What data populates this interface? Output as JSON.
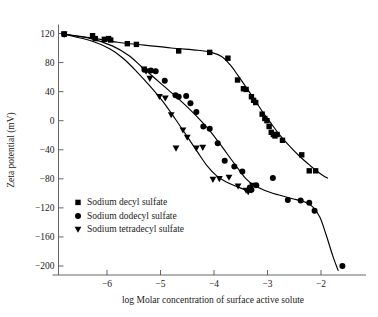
{
  "chart_data": {
    "type": "scatter",
    "title": "",
    "xlabel": "log Molar concentration of surface active solute",
    "ylabel": "Zeta potential (mV)",
    "xlim": [
      -7.0,
      -1.3
    ],
    "ylim": [
      -210,
      132
    ],
    "xticks": [
      -6,
      -5,
      -4,
      -3,
      -2
    ],
    "xtick_labels": [
      "−6",
      "−5",
      "−4",
      "−3",
      "−2"
    ],
    "yticks": [
      120,
      80,
      40,
      0,
      -40,
      -80,
      -120,
      -160,
      -200
    ],
    "ytick_labels": [
      "120",
      "80",
      "40",
      "0",
      "−40",
      "−80",
      "−120",
      "−160",
      "−200"
    ],
    "grid": false,
    "legend_position": "lower-left-inside",
    "series": [
      {
        "name": "Sodium decyl sulfate",
        "marker": "square",
        "color": "#000000",
        "points": [
          [
            -6.8,
            119
          ],
          [
            -6.27,
            117
          ],
          [
            -6.22,
            113
          ],
          [
            -6.05,
            112
          ],
          [
            -5.97,
            113
          ],
          [
            -5.93,
            111
          ],
          [
            -5.62,
            106
          ],
          [
            -5.45,
            105
          ],
          [
            -4.66,
            96
          ],
          [
            -4.08,
            94
          ],
          [
            -3.74,
            86
          ],
          [
            -3.56,
            56
          ],
          [
            -3.45,
            44
          ],
          [
            -3.4,
            43
          ],
          [
            -3.3,
            33
          ],
          [
            -3.26,
            28
          ],
          [
            -3.22,
            25
          ],
          [
            -3.1,
            9
          ],
          [
            -3.05,
            3
          ],
          [
            -3.01,
            0
          ],
          [
            -2.97,
            -8
          ],
          [
            -2.93,
            -16
          ],
          [
            -2.89,
            -19
          ],
          [
            -2.86,
            -21
          ],
          [
            -2.82,
            -19
          ],
          [
            -2.72,
            -27
          ],
          [
            -2.36,
            -47
          ],
          [
            -2.22,
            -69
          ],
          [
            -2.1,
            -69
          ]
        ],
        "curve": [
          [
            -6.8,
            119
          ],
          [
            -6.3,
            114
          ],
          [
            -5.8,
            108
          ],
          [
            -5.3,
            104
          ],
          [
            -4.8,
            100
          ],
          [
            -4.3,
            97
          ],
          [
            -4.05,
            94
          ],
          [
            -3.85,
            88
          ],
          [
            -3.7,
            77
          ],
          [
            -3.55,
            62
          ],
          [
            -3.4,
            46
          ],
          [
            -3.25,
            30
          ],
          [
            -3.1,
            13
          ],
          [
            -2.95,
            -2
          ],
          [
            -2.8,
            -17
          ],
          [
            -2.6,
            -34
          ],
          [
            -2.4,
            -49
          ],
          [
            -2.2,
            -62
          ],
          [
            -2.05,
            -71
          ],
          [
            -1.95,
            -76
          ],
          [
            -1.88,
            -79
          ]
        ]
      },
      {
        "name": "Sodium dodecyl sulfate",
        "marker": "circle",
        "color": "#000000",
        "points": [
          [
            -6.8,
            119
          ],
          [
            -5.3,
            70
          ],
          [
            -5.18,
            69
          ],
          [
            -5.09,
            68
          ],
          [
            -4.92,
            55
          ],
          [
            -4.72,
            35
          ],
          [
            -4.66,
            33
          ],
          [
            -4.52,
            34
          ],
          [
            -4.44,
            24
          ],
          [
            -4.33,
            12
          ],
          [
            -4.2,
            -8
          ],
          [
            -4.08,
            -11
          ],
          [
            -3.93,
            -31
          ],
          [
            -3.8,
            -55
          ],
          [
            -3.62,
            -63
          ],
          [
            -3.47,
            -70
          ],
          [
            -3.33,
            -92
          ],
          [
            -3.3,
            -95
          ],
          [
            -3.21,
            -89
          ],
          [
            -2.9,
            -79
          ],
          [
            -2.62,
            -109
          ],
          [
            -2.38,
            -110
          ],
          [
            -2.22,
            -113
          ],
          [
            -2.12,
            -124
          ],
          [
            -1.6,
            -200
          ]
        ],
        "curve": [
          [
            -6.8,
            119
          ],
          [
            -6.3,
            113
          ],
          [
            -5.9,
            103
          ],
          [
            -5.6,
            90
          ],
          [
            -5.35,
            74
          ],
          [
            -5.1,
            58
          ],
          [
            -4.85,
            42
          ],
          [
            -4.6,
            26
          ],
          [
            -4.35,
            8
          ],
          [
            -4.1,
            -12
          ],
          [
            -3.9,
            -31
          ],
          [
            -3.7,
            -51
          ],
          [
            -3.55,
            -66
          ],
          [
            -3.4,
            -80
          ],
          [
            -3.25,
            -89
          ],
          [
            -3.05,
            -96
          ],
          [
            -2.8,
            -102
          ],
          [
            -2.55,
            -107
          ],
          [
            -2.3,
            -112
          ],
          [
            -2.15,
            -119
          ],
          [
            -2.02,
            -133
          ],
          [
            -1.9,
            -158
          ],
          [
            -1.78,
            -186
          ],
          [
            -1.68,
            -206
          ]
        ]
      },
      {
        "name": "Sodium tetradecyl sulfate",
        "marker": "triangle-down",
        "color": "#000000",
        "points": [
          [
            -6.8,
            119
          ],
          [
            -5.31,
            71
          ],
          [
            -5.27,
            68
          ],
          [
            -5.2,
            58
          ],
          [
            -5.02,
            33
          ],
          [
            -4.91,
            31
          ],
          [
            -4.8,
            8
          ],
          [
            -4.71,
            -38
          ],
          [
            -4.58,
            -13
          ],
          [
            -4.5,
            -23
          ],
          [
            -4.33,
            -38
          ],
          [
            -4.21,
            -37
          ],
          [
            -4.02,
            -81
          ],
          [
            -3.9,
            -80
          ],
          [
            -3.72,
            -78
          ],
          [
            -3.55,
            -90
          ],
          [
            -3.4,
            -96
          ],
          [
            -3.36,
            -98
          ],
          [
            -3.28,
            -89
          ]
        ],
        "curve": [
          [
            -6.8,
            119
          ],
          [
            -6.3,
            110
          ],
          [
            -5.95,
            99
          ],
          [
            -5.7,
            86
          ],
          [
            -5.45,
            68
          ],
          [
            -5.2,
            48
          ],
          [
            -4.95,
            26
          ],
          [
            -4.72,
            2
          ],
          [
            -4.5,
            -22
          ],
          [
            -4.3,
            -44
          ],
          [
            -4.12,
            -63
          ],
          [
            -3.95,
            -76
          ],
          [
            -3.78,
            -84
          ],
          [
            -3.6,
            -90
          ],
          [
            -3.42,
            -95
          ],
          [
            -3.3,
            -99
          ]
        ]
      }
    ]
  },
  "legend": {
    "items": [
      {
        "label": "Sodium decyl sulfate",
        "marker": "square"
      },
      {
        "label": "Sodium dodecyl sulfate",
        "marker": "circle"
      },
      {
        "label": "Sodium tetradecyl sulfate",
        "marker": "triangle-down"
      }
    ]
  }
}
